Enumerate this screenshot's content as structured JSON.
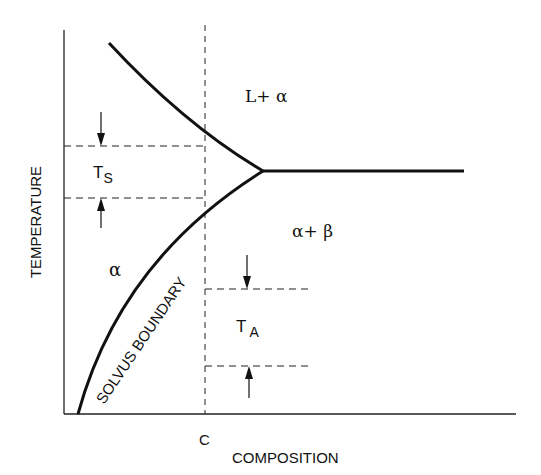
{
  "diagram": {
    "type": "phase-diagram",
    "axes": {
      "x_label": "COMPOSITION",
      "y_label": "TEMPERATURE",
      "x_tick_label": "C"
    },
    "regions": {
      "liquid_alpha": "L+ α",
      "alpha_beta": "α+ β",
      "alpha": "α"
    },
    "curves": {
      "solvus_label": "SOLVUS BOUNDARY"
    },
    "intervals": {
      "solution_temp": {
        "main": "T",
        "sub": "S"
      },
      "aging_temp": {
        "main": "T",
        "sub": "A"
      }
    },
    "colors": {
      "line": "#111111",
      "background": "#ffffff"
    }
  }
}
